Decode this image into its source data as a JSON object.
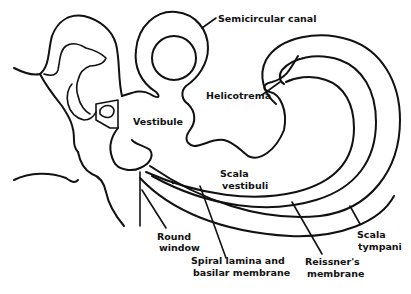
{
  "diagram": {
    "line_color": "#111111",
    "background": "#ffffff",
    "labels": {
      "semicircular_canal": "Semicircular canal",
      "helicotrema": "Helicotrema",
      "vestibule": "Vestibule",
      "scala_vestibuli_1": "Scala",
      "scala_vestibuli_2": "vestibuli",
      "round_window_1": "Round",
      "round_window_2": "window",
      "spiral_lamina_1": "Spiral lamina and",
      "spiral_lamina_2": "basilar membrane",
      "reissners_1": "Reissner's",
      "reissners_2": "membrane",
      "scala_tympani_1": "Scala",
      "scala_tympani_2": "tympani"
    }
  }
}
